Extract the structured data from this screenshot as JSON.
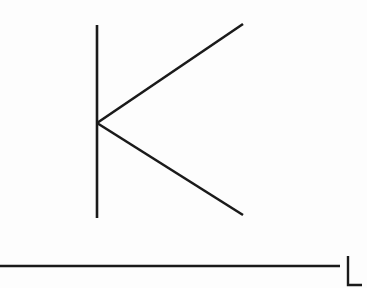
{
  "figure": {
    "width": 367,
    "height": 288,
    "background_color": "#fdfdfd",
    "stroke_color": "#1a1a1a",
    "stroke_width": 2.6,
    "shapes": [
      {
        "name": "k-vertical-stroke",
        "label": "K vertical stem",
        "type": "line",
        "x1": 97,
        "y1": 25,
        "x2": 97,
        "y2": 218
      },
      {
        "name": "k-upper-diagonal",
        "label": "K upper arm",
        "type": "line",
        "x1": 97,
        "y1": 123,
        "x2": 243,
        "y2": 24
      },
      {
        "name": "k-lower-diagonal",
        "label": "K lower leg",
        "type": "line",
        "x1": 97,
        "y1": 123,
        "x2": 243,
        "y2": 215
      },
      {
        "name": "horizontal-baseline",
        "label": "Long horizontal rule",
        "type": "line",
        "x1": 0,
        "y1": 266,
        "x2": 340,
        "y2": 266
      },
      {
        "name": "l-vertical-stroke",
        "label": "L vertical stem",
        "type": "line",
        "x1": 348,
        "y1": 256,
        "x2": 348,
        "y2": 285
      },
      {
        "name": "l-foot-stroke",
        "label": "L horizontal foot",
        "type": "line",
        "x1": 347,
        "y1": 285,
        "x2": 362,
        "y2": 285
      }
    ],
    "vertex_point": {
      "label": "K junction vertex",
      "x": 97,
      "y": 123
    }
  }
}
